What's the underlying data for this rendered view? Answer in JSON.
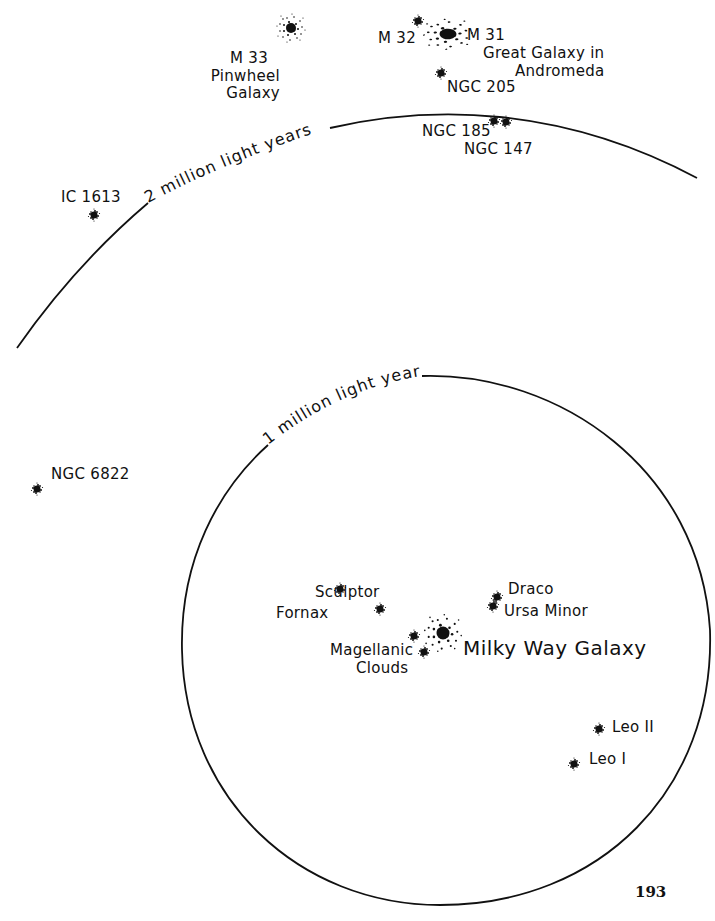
{
  "diagram": {
    "rings": [
      {
        "label": "2 million light years",
        "kind": "arc"
      },
      {
        "label": "1 million light years",
        "kind": "circle"
      }
    ],
    "center": {
      "name": "Milky Way Galaxy"
    },
    "galaxies": {
      "m33": {
        "line1": "M 33",
        "line2": "Pinwheel",
        "line3": "Galaxy"
      },
      "m32": {
        "name": "M 32"
      },
      "m31": {
        "line1": "M 31",
        "line2": "Great Galaxy in",
        "line3": "Andromeda"
      },
      "ngc205": {
        "name": "NGC 205"
      },
      "ngc185": {
        "name": "NGC 185"
      },
      "ngc147": {
        "name": "NGC 147"
      },
      "ic1613": {
        "name": "IC 1613"
      },
      "ngc6822": {
        "name": "NGC 6822"
      },
      "sculptor": {
        "name": "Sculptor"
      },
      "fornax": {
        "name": "Fornax"
      },
      "magellanic": {
        "line1": "Magellanic",
        "line2": "Clouds"
      },
      "draco": {
        "name": "Draco"
      },
      "ursaminor": {
        "name": "Ursa Minor"
      },
      "leo2": {
        "name": "Leo II"
      },
      "leo1": {
        "name": "Leo I"
      }
    }
  },
  "page": {
    "number": "193"
  }
}
